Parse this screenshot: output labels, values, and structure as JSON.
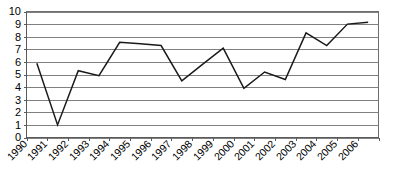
{
  "chart_data": {
    "type": "line",
    "title": "",
    "subtitle": "",
    "xlabel": "",
    "ylabel": "",
    "categories": [
      "1990",
      "1991",
      "1992",
      "1993",
      "1994",
      "1995",
      "1996",
      "1997",
      "1998",
      "1999",
      "2000",
      "2001",
      "2002",
      "2003",
      "2004",
      "2005",
      "2006"
    ],
    "values": [
      5.9,
      1.0,
      5.3,
      4.9,
      7.55,
      7.45,
      7.3,
      4.5,
      5.8,
      7.1,
      3.9,
      5.2,
      4.6,
      8.3,
      7.3,
      9.0,
      9.15
    ],
    "series": [
      {
        "name": "series-1",
        "values": [
          5.9,
          1.0,
          5.3,
          4.9,
          7.55,
          7.45,
          7.3,
          4.5,
          5.8,
          7.1,
          3.9,
          5.2,
          4.6,
          8.3,
          7.3,
          9.0,
          9.15
        ],
        "color": "#1a1a1a"
      }
    ],
    "ylim": [
      0,
      10
    ],
    "yticks": [
      0,
      1,
      2,
      3,
      4,
      5,
      6,
      7,
      8,
      9,
      10
    ],
    "ytick_labels": [
      "0",
      "1",
      "2",
      "3",
      "4",
      "5",
      "6",
      "7",
      "8",
      "9",
      "10"
    ],
    "xtick_labels": [
      "1990",
      "1991",
      "1992",
      "1993",
      "1994",
      "1995",
      "1996",
      "1997",
      "1998",
      "1999",
      "2000",
      "2001",
      "2002",
      "2003",
      "2004",
      "2005",
      "2006"
    ],
    "xtick_rotation": -45,
    "grid": true,
    "grid_axis": "y",
    "legend": false,
    "legend_position": "none",
    "annotations": [],
    "colors": {
      "line": "#1a1a1a",
      "grid": "#808080",
      "axis": "#5a5a5a",
      "background": "#ffffff",
      "text": "#000000"
    }
  }
}
